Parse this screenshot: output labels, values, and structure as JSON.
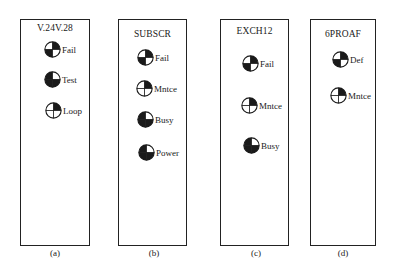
{
  "panels": [
    {
      "id": "a",
      "title": "V.24V.28",
      "caption": "(a)",
      "indicators": [
        {
          "label": "Fail",
          "quadrants": {
            "tl": "white",
            "tr": "black",
            "bl": "black",
            "br": "white"
          }
        },
        {
          "label": "Test",
          "quadrants": {
            "tl": "black",
            "tr": "white",
            "bl": "black",
            "br": "black"
          }
        },
        {
          "label": "Loop",
          "quadrants": {
            "tl": "white",
            "tr": "black",
            "bl": "white",
            "br": "white"
          }
        }
      ]
    },
    {
      "id": "b",
      "title": "SUBSCR",
      "caption": "(b)",
      "indicators": [
        {
          "label": "Fail",
          "quadrants": {
            "tl": "white",
            "tr": "black",
            "bl": "black",
            "br": "white"
          }
        },
        {
          "label": "Mntce",
          "quadrants": {
            "tl": "white",
            "tr": "black",
            "bl": "white",
            "br": "white"
          }
        },
        {
          "label": "Busy",
          "quadrants": {
            "tl": "black",
            "tr": "white",
            "bl": "black",
            "br": "black"
          }
        },
        {
          "label": "Power",
          "quadrants": {
            "tl": "black",
            "tr": "white",
            "bl": "black",
            "br": "black"
          }
        }
      ]
    },
    {
      "id": "c",
      "title": "EXCH12",
      "caption": "(c)",
      "indicators": [
        {
          "label": "Fail",
          "quadrants": {
            "tl": "white",
            "tr": "black",
            "bl": "black",
            "br": "white"
          }
        },
        {
          "label": "Mntce",
          "quadrants": {
            "tl": "white",
            "tr": "black",
            "bl": "white",
            "br": "white"
          }
        },
        {
          "label": "Busy",
          "quadrants": {
            "tl": "black",
            "tr": "white",
            "bl": "black",
            "br": "black"
          }
        }
      ]
    },
    {
      "id": "d",
      "title": "6PROAF",
      "caption": "(d)",
      "indicators": [
        {
          "label": "Def",
          "quadrants": {
            "tl": "white",
            "tr": "black",
            "bl": "black",
            "br": "white"
          }
        },
        {
          "label": "Mntce",
          "quadrants": {
            "tl": "white",
            "tr": "black",
            "bl": "white",
            "br": "white"
          }
        }
      ]
    }
  ],
  "colors": {
    "ink": "#1a1a1a",
    "background": "#ffffff"
  }
}
